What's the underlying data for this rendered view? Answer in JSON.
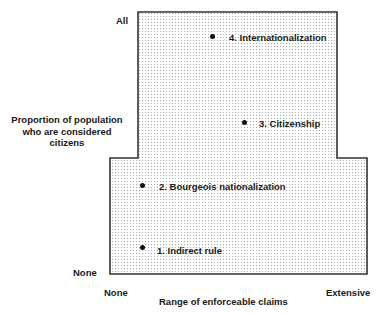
{
  "diagram": {
    "y_axis": {
      "title": "Proportion of population who are considered citizens",
      "top_label": "All",
      "bottom_label": "None"
    },
    "x_axis": {
      "title": "Range of enforceable claims",
      "left_label": "None",
      "right_label": "Extensive"
    },
    "region": {
      "fill": "dotted",
      "shape": "inverted-T / stepped polygon",
      "border_color": "#333333",
      "dot_color": "#9a9a9a"
    },
    "points": [
      {
        "id": 1,
        "label": "1. Indirect rule",
        "x": 143,
        "y": 248
      },
      {
        "id": 2,
        "label": "2. Bourgeois nationalization",
        "x": 143,
        "y": 186
      },
      {
        "id": 3,
        "label": "3. Citizenship",
        "x": 246,
        "y": 123
      },
      {
        "id": 4,
        "label": "4. Internationalization",
        "x": 213,
        "y": 37
      }
    ]
  }
}
